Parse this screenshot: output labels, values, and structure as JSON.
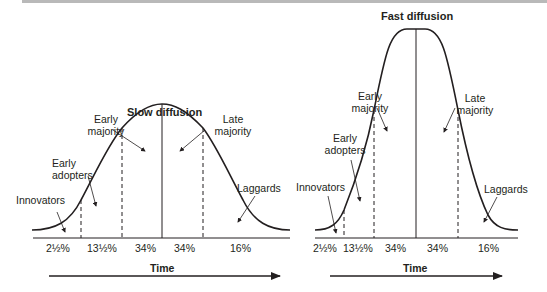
{
  "charts": [
    {
      "title": "Slow diffusion",
      "segments": [
        {
          "label": "Innovators",
          "percent": "2½%"
        },
        {
          "label": "Early adopters",
          "percent": "13½%"
        },
        {
          "label": "Early majority",
          "percent": "34%"
        },
        {
          "label": "Late majority",
          "percent": "34%"
        },
        {
          "label": "Laggards",
          "percent": "16%"
        }
      ],
      "labels": {
        "innovators": "Innovators",
        "early_adopters_1": "Early",
        "early_adopters_2": "adopters",
        "early_majority_1": "Early",
        "early_majority_2": "majority",
        "late_majority_1": "Late",
        "late_majority_2": "majority",
        "laggards": "Laggards"
      },
      "axis_label": "Time"
    },
    {
      "title": "Fast diffusion",
      "segments": [
        {
          "label": "Innovators",
          "percent": "2½%"
        },
        {
          "label": "Early adopters",
          "percent": "13½%"
        },
        {
          "label": "Early majority",
          "percent": "34%"
        },
        {
          "label": "Late majority",
          "percent": "34%"
        },
        {
          "label": "Laggards",
          "percent": "16%"
        }
      ],
      "labels": {
        "innovators": "Innovators",
        "early_adopters_1": "Early",
        "early_adopters_2": "adopters",
        "early_majority_1": "Early",
        "early_majority_2": "majority",
        "late_majority_1": "Late",
        "late_majority_2": "majority",
        "laggards": "Laggards"
      },
      "axis_label": "Time"
    }
  ],
  "colors": {
    "line": "#231f20",
    "background": "#ffffff"
  }
}
